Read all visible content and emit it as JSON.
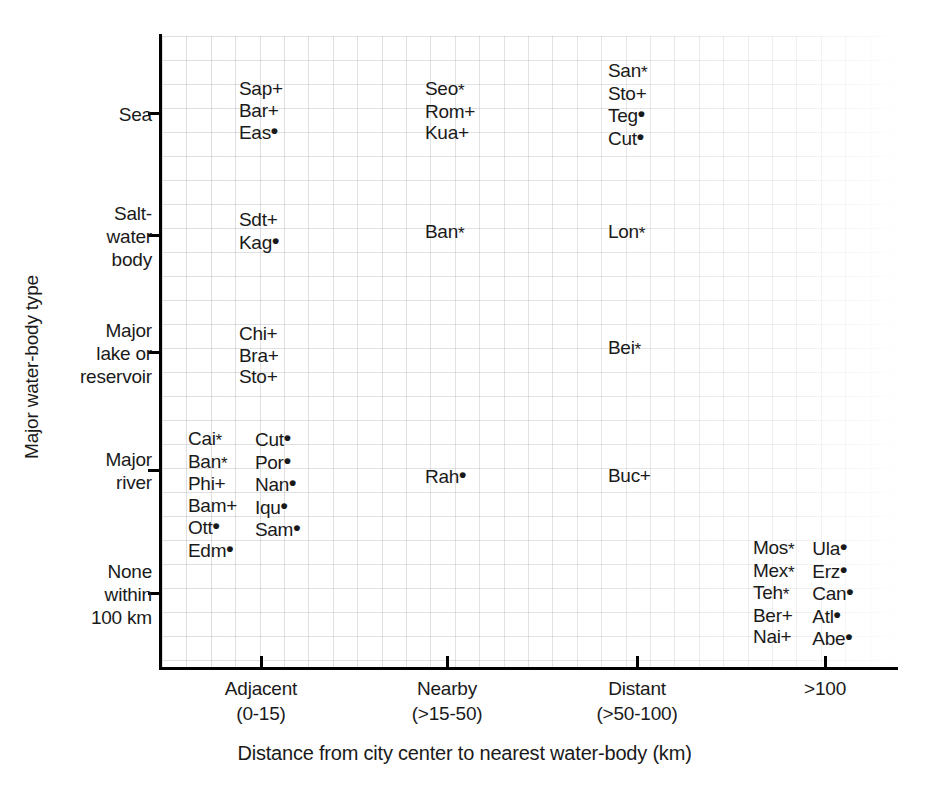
{
  "chart_data": {
    "type": "scatter",
    "title": "",
    "xlabel": "Distance from city center to nearest water-body (km)",
    "ylabel": "Major water-body type",
    "grid": true,
    "legend": null,
    "x_categories": [
      {
        "label": "Adjacent",
        "sub": "(0-15)"
      },
      {
        "label": "Nearby",
        "sub": "(>15-50)"
      },
      {
        "label": "Distant",
        "sub": "(>50-100)"
      },
      {
        "label": ">100",
        "sub": ""
      }
    ],
    "y_categories": [
      {
        "lines": [
          "Sea"
        ]
      },
      {
        "lines": [
          "Salt-",
          "water",
          "body"
        ]
      },
      {
        "lines": [
          "Major",
          "lake or",
          "reservoir"
        ]
      },
      {
        "lines": [
          "Major",
          "river"
        ]
      },
      {
        "lines": [
          "None",
          "within",
          "100 km"
        ]
      }
    ],
    "marker_legend": [
      {
        "symbol": "*",
        "name": "star-marker"
      },
      {
        "symbol": "+",
        "name": "plus-marker"
      },
      {
        "symbol": "•",
        "name": "dot-marker"
      }
    ],
    "points": [
      {
        "x": "Adjacent",
        "y": "Sea",
        "col": 0,
        "name": "Sap",
        "marker": "+"
      },
      {
        "x": "Adjacent",
        "y": "Sea",
        "col": 0,
        "name": "Bar",
        "marker": "+"
      },
      {
        "x": "Adjacent",
        "y": "Sea",
        "col": 0,
        "name": "Eas",
        "marker": "•"
      },
      {
        "x": "Nearby",
        "y": "Sea",
        "col": 0,
        "name": "Seo",
        "marker": "*"
      },
      {
        "x": "Nearby",
        "y": "Sea",
        "col": 0,
        "name": "Rom",
        "marker": "+"
      },
      {
        "x": "Nearby",
        "y": "Sea",
        "col": 0,
        "name": "Kua",
        "marker": "+"
      },
      {
        "x": "Distant",
        "y": "Sea",
        "col": 0,
        "name": "San",
        "marker": "*"
      },
      {
        "x": "Distant",
        "y": "Sea",
        "col": 0,
        "name": "Sto",
        "marker": "+"
      },
      {
        "x": "Distant",
        "y": "Sea",
        "col": 0,
        "name": "Teg",
        "marker": "•"
      },
      {
        "x": "Distant",
        "y": "Sea",
        "col": 0,
        "name": "Cut",
        "marker": "•"
      },
      {
        "x": "Adjacent",
        "y": "Salt-water body",
        "col": 0,
        "name": "Sdt",
        "marker": "+"
      },
      {
        "x": "Adjacent",
        "y": "Salt-water body",
        "col": 0,
        "name": "Kag",
        "marker": "•"
      },
      {
        "x": "Nearby",
        "y": "Salt-water body",
        "col": 0,
        "name": "Ban",
        "marker": "*"
      },
      {
        "x": "Distant",
        "y": "Salt-water body",
        "col": 0,
        "name": "Lon",
        "marker": "*"
      },
      {
        "x": "Adjacent",
        "y": "Major lake or reservoir",
        "col": 0,
        "name": "Chi",
        "marker": "+"
      },
      {
        "x": "Adjacent",
        "y": "Major lake or reservoir",
        "col": 0,
        "name": "Bra",
        "marker": "+"
      },
      {
        "x": "Adjacent",
        "y": "Major lake or reservoir",
        "col": 0,
        "name": "Sto",
        "marker": "+"
      },
      {
        "x": "Distant",
        "y": "Major lake or reservoir",
        "col": 0,
        "name": "Bei",
        "marker": "*"
      },
      {
        "x": "Adjacent",
        "y": "Major river",
        "col": 0,
        "name": "Cai",
        "marker": "*"
      },
      {
        "x": "Adjacent",
        "y": "Major river",
        "col": 0,
        "name": "Ban",
        "marker": "*"
      },
      {
        "x": "Adjacent",
        "y": "Major river",
        "col": 0,
        "name": "Phi",
        "marker": "+"
      },
      {
        "x": "Adjacent",
        "y": "Major river",
        "col": 0,
        "name": "Bam",
        "marker": "+"
      },
      {
        "x": "Adjacent",
        "y": "Major river",
        "col": 0,
        "name": "Ott",
        "marker": "•"
      },
      {
        "x": "Adjacent",
        "y": "Major river",
        "col": 0,
        "name": "Edm",
        "marker": "•"
      },
      {
        "x": "Adjacent",
        "y": "Major river",
        "col": 1,
        "name": "Cut",
        "marker": "•"
      },
      {
        "x": "Adjacent",
        "y": "Major river",
        "col": 1,
        "name": "Por",
        "marker": "•"
      },
      {
        "x": "Adjacent",
        "y": "Major river",
        "col": 1,
        "name": "Nan",
        "marker": "•"
      },
      {
        "x": "Adjacent",
        "y": "Major river",
        "col": 1,
        "name": "Iqu",
        "marker": "•"
      },
      {
        "x": "Adjacent",
        "y": "Major river",
        "col": 1,
        "name": "Sam",
        "marker": "•"
      },
      {
        "x": "Nearby",
        "y": "Major river",
        "col": 0,
        "name": "Rah",
        "marker": "•"
      },
      {
        "x": "Distant",
        "y": "Major river",
        "col": 0,
        "name": "Buc",
        "marker": "+"
      },
      {
        "x": ">100",
        "y": "None within 100 km",
        "col": 0,
        "name": "Mos",
        "marker": "*"
      },
      {
        "x": ">100",
        "y": "None within 100 km",
        "col": 0,
        "name": "Mex",
        "marker": "*"
      },
      {
        "x": ">100",
        "y": "None within 100 km",
        "col": 0,
        "name": "Teh",
        "marker": "*"
      },
      {
        "x": ">100",
        "y": "None within 100 km",
        "col": 0,
        "name": "Ber",
        "marker": "+"
      },
      {
        "x": ">100",
        "y": "None within 100 km",
        "col": 0,
        "name": "Nai",
        "marker": "+"
      },
      {
        "x": ">100",
        "y": "None within 100 km",
        "col": 1,
        "name": "Ula",
        "marker": "•"
      },
      {
        "x": ">100",
        "y": "None within 100 km",
        "col": 1,
        "name": "Erz",
        "marker": "•"
      },
      {
        "x": ">100",
        "y": "None within 100 km",
        "col": 1,
        "name": "Can",
        "marker": "•"
      },
      {
        "x": ">100",
        "y": "None within 100 km",
        "col": 1,
        "name": "Atl",
        "marker": "•"
      },
      {
        "x": ">100",
        "y": "None within 100 km",
        "col": 1,
        "name": "Abe",
        "marker": "•"
      }
    ]
  },
  "layout": {
    "x_tick_px": [
      261,
      447,
      637,
      825
    ],
    "y_tick_px": [
      113,
      235,
      352,
      470,
      593
    ],
    "clusters": [
      {
        "id": "sea-adjacent",
        "left": 239,
        "top": 78,
        "cols": 1
      },
      {
        "id": "sea-nearby",
        "left": 425,
        "top": 78,
        "cols": 1
      },
      {
        "id": "sea-distant",
        "left": 608,
        "top": 60,
        "cols": 1
      },
      {
        "id": "salt-adjacent",
        "left": 239,
        "top": 209,
        "cols": 1
      },
      {
        "id": "salt-nearby",
        "left": 425,
        "top": 221,
        "cols": 1
      },
      {
        "id": "salt-distant",
        "left": 608,
        "top": 221,
        "cols": 1
      },
      {
        "id": "lake-adjacent",
        "left": 239,
        "top": 323,
        "cols": 1
      },
      {
        "id": "lake-distant",
        "left": 608,
        "top": 337,
        "cols": 1
      },
      {
        "id": "river-adjacent",
        "left": 188,
        "top": 428,
        "cols": 2
      },
      {
        "id": "river-nearby",
        "left": 425,
        "top": 465,
        "cols": 1
      },
      {
        "id": "river-distant",
        "left": 608,
        "top": 465,
        "cols": 1
      },
      {
        "id": "none-gt100",
        "left": 753,
        "top": 537,
        "cols": 2
      }
    ]
  },
  "colors": {
    "axis": "#000000",
    "text": "#1a1a1a",
    "grid": "#96969a",
    "background": "#ffffff"
  }
}
